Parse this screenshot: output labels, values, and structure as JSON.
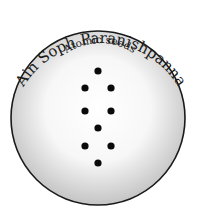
{
  "diagram": {
    "outer_label": "Ain Soph Paranishpanna",
    "inner_label": "Atomic seeds",
    "circle": {
      "cx": 98,
      "cy": 118,
      "r": 87,
      "stroke": "#1a1a1a",
      "fill_center": "#ffffff",
      "fill_edge": "#c8c8c8"
    },
    "dots": [
      {
        "x": 98,
        "y": 71
      },
      {
        "x": 85,
        "y": 88
      },
      {
        "x": 111,
        "y": 88
      },
      {
        "x": 85,
        "y": 111
      },
      {
        "x": 111,
        "y": 111
      },
      {
        "x": 98,
        "y": 128
      },
      {
        "x": 85,
        "y": 146
      },
      {
        "x": 111,
        "y": 146
      },
      {
        "x": 98,
        "y": 163
      }
    ],
    "dot_color": "#0a0a0a"
  }
}
